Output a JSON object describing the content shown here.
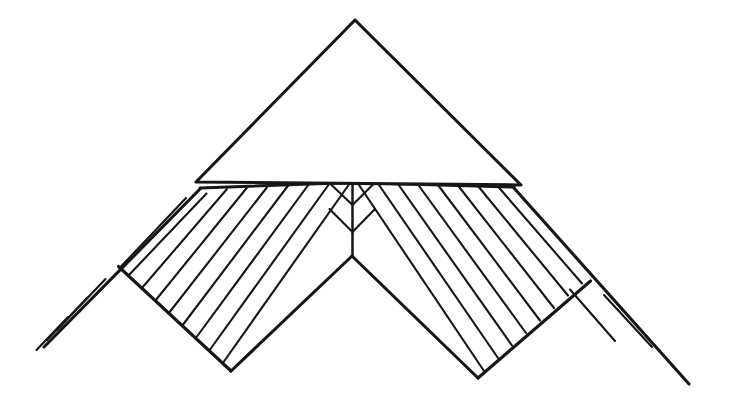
{
  "document": {
    "title": "Hatched chevron with triangular wedge",
    "kind": "technical-line-drawing",
    "background_color": "#ffffff",
    "ink_color": "#161616",
    "canvas": {
      "width": 736,
      "height": 413
    }
  },
  "figure": {
    "name": "chevron-hatched-diagram",
    "parts": [
      {
        "id": "triangle",
        "label": "triangular wedge",
        "filled": false
      },
      {
        "id": "band-left",
        "label": "left hatched band",
        "filled": false,
        "hatched": true
      },
      {
        "id": "band-right",
        "label": "right hatched band",
        "filled": false,
        "hatched": true
      },
      {
        "id": "center-notch",
        "label": "central vertical seam and notch",
        "filled": false
      },
      {
        "id": "tail-left",
        "label": "left extending edge with hatch ticks",
        "filled": false
      },
      {
        "id": "tail-right",
        "label": "right extending edge with hatch ticks",
        "filled": false
      }
    ],
    "geometry": {
      "triangle": {
        "apex": [
          355,
          20
        ],
        "base_left": [
          196,
          182
        ],
        "base_right": [
          521,
          185
        ]
      },
      "band": {
        "top_edge_left": [
          200,
          188
        ],
        "top_edge_center": [
          353,
          183
        ],
        "top_edge_right": [
          514,
          187
        ],
        "center_seam_bottom": [
          352,
          256
        ],
        "left_outer_corner": [
          118,
          267
        ],
        "left_bottom_corner": [
          231,
          371
        ],
        "right_outer_corner": [
          590,
          281
        ],
        "right_bottom_corner": [
          478,
          378
        ]
      },
      "tails": {
        "left_end": [
          44,
          347
        ],
        "right_end": [
          689,
          384
        ]
      }
    },
    "hatching": {
      "left_band_line_count": 13,
      "right_band_line_count": 13,
      "left_tail_tick_count": 3,
      "right_tail_tick_count": 2,
      "orientation": "perpendicular to band axis"
    }
  }
}
